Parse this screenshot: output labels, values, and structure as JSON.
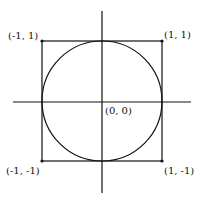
{
  "diagram": {
    "labels": {
      "top_left": "(-1, 1)",
      "top_right": "(1, 1)",
      "bottom_left": "(-1, -1)",
      "bottom_right": "(1, -1)",
      "origin": "(0, 0)"
    },
    "colors": {
      "stroke": "#111111",
      "background": "#ffffff"
    }
  }
}
